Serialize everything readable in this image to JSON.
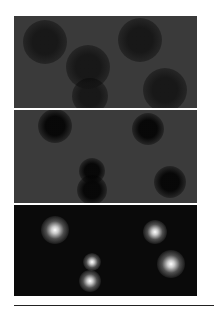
{
  "figure": {
    "panels": [
      {
        "id": "panel-1",
        "top": 16,
        "height": 92,
        "background": "#3a3a3a",
        "spot_color": "rgba(18,18,18,0.85)",
        "spot_type": "dark",
        "spots": [
          {
            "x": 31,
            "y": 26,
            "r": 22
          },
          {
            "x": 74,
            "y": 51,
            "r": 22
          },
          {
            "x": 126,
            "y": 24,
            "r": 22
          },
          {
            "x": 151,
            "y": 74,
            "r": 22
          },
          {
            "x": 76,
            "y": 80,
            "r": 18
          }
        ]
      },
      {
        "id": "panel-2",
        "top": 110,
        "height": 93,
        "background": "#3b3b3b",
        "spot_color": "rgba(5,5,5,0.95)",
        "spot_type": "dark",
        "spots": [
          {
            "x": 41,
            "y": 16,
            "r": 17
          },
          {
            "x": 78,
            "y": 61,
            "r": 13
          },
          {
            "x": 78,
            "y": 80,
            "r": 15
          },
          {
            "x": 134,
            "y": 19,
            "r": 16
          },
          {
            "x": 156,
            "y": 72,
            "r": 16
          }
        ]
      },
      {
        "id": "panel-3",
        "top": 205,
        "height": 91,
        "background": "#0a0a0a",
        "spot_color": "rgba(255,255,255,1)",
        "spot_type": "bright",
        "spots": [
          {
            "x": 41,
            "y": 25,
            "r": 14
          },
          {
            "x": 78,
            "y": 57,
            "r": 9
          },
          {
            "x": 76,
            "y": 76,
            "r": 11
          },
          {
            "x": 141,
            "y": 27,
            "r": 12
          },
          {
            "x": 157,
            "y": 59,
            "r": 14
          }
        ]
      }
    ],
    "rule": {
      "visible": true
    }
  }
}
